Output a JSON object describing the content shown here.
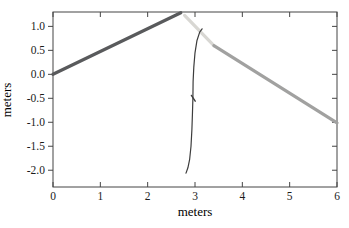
{
  "chart_data": {
    "type": "line",
    "title": "",
    "xlabel": "meters",
    "ylabel": "meters",
    "xlim": [
      0,
      6
    ],
    "ylim": [
      -2.35,
      1.3
    ],
    "xticks": [
      0,
      1,
      2,
      3,
      4,
      5,
      6
    ],
    "xtick_labels": [
      "0",
      "1",
      "2",
      "3",
      "4",
      "5",
      "6"
    ],
    "yticks": [
      1.0,
      0.5,
      0.0,
      -0.5,
      -1.0,
      -1.5,
      -2.0
    ],
    "ytick_labels": [
      "1.0",
      "0.5",
      "0.0",
      "-0.5",
      "-1.0",
      "-1.5",
      "-2.0"
    ],
    "grid": false,
    "legend": null,
    "frame": "box",
    "axis_color": "#454545",
    "text_color": "#1b1b1b",
    "background": "#ffffff",
    "series": [
      {
        "name": "rising-dark-segment",
        "color": "#595a5c",
        "width": 3.2,
        "points": [
          [
            0.0,
            0.0
          ],
          [
            2.7,
            1.285
          ]
        ]
      },
      {
        "name": "descending-light-segment",
        "color": "#d8d7d3",
        "width": 3.2,
        "points": [
          [
            2.78,
            1.23
          ],
          [
            3.4,
            0.6
          ]
        ]
      },
      {
        "name": "descending-medium-segment",
        "color": "#a1a1a0",
        "width": 3.2,
        "points": [
          [
            3.4,
            0.6
          ],
          [
            6.0,
            -1.01
          ]
        ]
      },
      {
        "name": "thin-vertical-curve",
        "color": "#3d3d3d",
        "width": 1.2,
        "points": [
          [
            3.15,
            0.95
          ],
          [
            3.1,
            0.88
          ],
          [
            3.04,
            0.7
          ],
          [
            3.0,
            0.45
          ],
          [
            2.975,
            0.15
          ],
          [
            2.96,
            -0.15
          ],
          [
            2.955,
            -0.5
          ],
          [
            2.945,
            -0.85
          ],
          [
            2.935,
            -1.15
          ],
          [
            2.915,
            -1.5
          ],
          [
            2.885,
            -1.78
          ],
          [
            2.85,
            -1.95
          ],
          [
            2.81,
            -2.06
          ]
        ]
      },
      {
        "name": "curve-tick-mark",
        "color": "#3d3d3d",
        "width": 1.4,
        "points": [
          [
            2.925,
            -0.44
          ],
          [
            3.005,
            -0.56
          ]
        ]
      }
    ]
  }
}
